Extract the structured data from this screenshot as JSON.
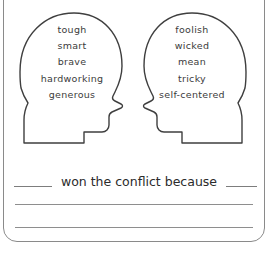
{
  "worksheet": {
    "background_color": "#ffffff",
    "frame_color": "#8a8a8a",
    "outline_color": "#3f3f3f",
    "text_color": "#3b3b3b",
    "prompt_color": "#2b2b2b",
    "rule_color": "#8e8e8e"
  },
  "head_left": {
    "label": "left-character-head",
    "words": [
      "tough",
      "smart",
      "brave",
      "hardworking",
      "generous"
    ]
  },
  "head_right": {
    "label": "right-character-head",
    "words": [
      "foolish",
      "wicked",
      "mean",
      "tricky",
      "self-centered"
    ]
  },
  "prompt": {
    "blank_before": "",
    "text": "won the conflict because",
    "blank_after": ""
  },
  "answer_lines": [
    "",
    ""
  ]
}
